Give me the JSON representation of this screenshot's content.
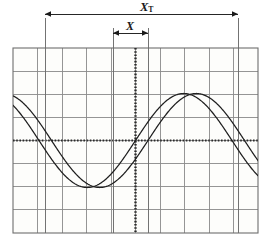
{
  "figure": {
    "kind": "oscilloscope-graticule-waveform-diagram",
    "background_color": "#ffffff",
    "grid": {
      "x_left": 13,
      "x_right": 258,
      "y_top": 48,
      "y_bottom": 233,
      "columns": 10,
      "rows": 8,
      "line_color": "#8a8a8a",
      "border_color": "#6e6e6e",
      "fill_color": "#fdfdfb"
    },
    "axes": {
      "style": "dotted",
      "color": "#2b2b2b",
      "center_x": 135.5,
      "center_y": 140.5
    }
  },
  "labels": {
    "period_label": "X",
    "period_subscript": "T",
    "phase_label": "X"
  },
  "dimensions": [
    {
      "name": "period",
      "label": "X_T",
      "y": 14,
      "x_start": 45,
      "x_end": 238,
      "value_px": 193,
      "meaning": "full waveform period"
    },
    {
      "name": "phase-shift",
      "label": "X",
      "y": 33,
      "x_start": 113,
      "x_end": 148,
      "value_px": 35,
      "meaning": "phase difference between the two traces"
    }
  ],
  "markers": [
    {
      "name": "period-start-marker",
      "x": 45,
      "y_top": 18,
      "y_bottom": 233
    },
    {
      "name": "phase-start-marker",
      "x": 113,
      "y_top": 28,
      "y_bottom": 233
    },
    {
      "name": "phase-end-marker",
      "x": 148,
      "y_top": 28,
      "y_bottom": 233
    },
    {
      "name": "period-end-marker",
      "x": 238,
      "y_top": 18,
      "y_bottom": 233
    }
  ],
  "chart_data": {
    "type": "line",
    "title": "",
    "xlabel": "",
    "ylabel": "",
    "grid": true,
    "legend": "none",
    "xlim": [
      13,
      258
    ],
    "ylim": [
      233,
      48
    ],
    "divisions_x": 10,
    "divisions_y": 8,
    "division_px_x": 24.5,
    "division_px_y": 23.125,
    "axis_zero_px": {
      "x": 135.5,
      "y": 140.5
    },
    "annotations": [
      {
        "text": "X_T",
        "x": 140,
        "y": 8,
        "role": "period-dimension-label"
      },
      {
        "text": "X",
        "x": 129,
        "y": 26,
        "role": "phase-dimension-label"
      }
    ],
    "series": [
      {
        "name": "trace-1",
        "color": "#1f1f1f",
        "waveform": "sine",
        "amplitude_px": 47,
        "amplitude_div": 2.03,
        "period_px": 193,
        "zero_cross_rising_px": 135.5,
        "phase_deg": 0,
        "x": [
          13,
          26,
          39,
          52,
          65,
          78,
          91,
          104,
          117,
          130,
          143,
          156,
          169,
          182,
          195,
          208,
          221,
          234,
          247,
          258
        ],
        "y": [
          107,
          119,
          131,
          143,
          155,
          166,
          175,
          182,
          186,
          187,
          184,
          178,
          169,
          158,
          146,
          133,
          121,
          110,
          101,
          96
        ]
      },
      {
        "name": "trace-2",
        "color": "#1f1f1f",
        "waveform": "sine",
        "amplitude_px": 47,
        "amplitude_div": 2.03,
        "period_px": 193,
        "zero_cross_rising_px": 148,
        "phase_deg": -23.3,
        "x": [
          13,
          26,
          39,
          52,
          65,
          78,
          91,
          104,
          117,
          130,
          143,
          156,
          169,
          182,
          195,
          208,
          221,
          234,
          247,
          258
        ],
        "y": [
          96,
          101,
          110,
          121,
          133,
          146,
          158,
          169,
          178,
          184,
          187,
          186,
          182,
          175,
          166,
          155,
          143,
          131,
          119,
          110
        ]
      }
    ]
  }
}
